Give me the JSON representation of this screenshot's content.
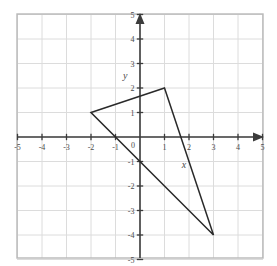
{
  "figure": {
    "title": "",
    "axis_label_x": "x",
    "axis_label_y": "y",
    "origin_label": "0"
  },
  "chart_data": {
    "type": "scatter",
    "title": "",
    "xlabel": "x",
    "ylabel": "y",
    "xlim": [
      -5,
      5
    ],
    "ylim": [
      -5,
      5
    ],
    "grid": true,
    "legend": "none",
    "x_ticks": [
      -5,
      -4,
      -3,
      -2,
      -1,
      0,
      1,
      2,
      3,
      4,
      5
    ],
    "y_ticks": [
      -5,
      -4,
      -3,
      -2,
      -1,
      0,
      1,
      2,
      3,
      4,
      5
    ],
    "x_tick_labels": [
      "-5",
      "-4",
      "-3",
      "-2",
      "-1",
      "0",
      "1",
      "2",
      "3",
      "4",
      "5"
    ],
    "y_tick_labels": [
      "-5",
      "-4",
      "-3",
      "-2",
      "-1",
      "0",
      "1",
      "2",
      "3",
      "4",
      "5"
    ],
    "annotations": [
      {
        "text": "y",
        "x": -0.6,
        "y": 2.35,
        "style": "italic"
      },
      {
        "text": "x",
        "x": 1.8,
        "y": -1.25,
        "style": "italic"
      }
    ],
    "series": [
      {
        "name": "triangle",
        "type": "polygon",
        "closed": true,
        "fill": "none",
        "stroke": "#2a2a2a",
        "points": [
          {
            "x": -2,
            "y": 1
          },
          {
            "x": 1,
            "y": 2
          },
          {
            "x": 3,
            "y": -4
          }
        ]
      }
    ]
  },
  "colors": {
    "grid": "#dcdcdc",
    "border": "#b8b8b8",
    "axis": "#3c3c3c",
    "shape_stroke": "#2a2a2a",
    "background": "#ffffff",
    "tick_text": "#4a4a4a"
  },
  "geometry": {
    "origin_x": 140,
    "origin_y": 137,
    "unit_px": 24.5,
    "plot_left": 17,
    "plot_top": 14,
    "plot_right": 263,
    "plot_bottom": 258
  }
}
